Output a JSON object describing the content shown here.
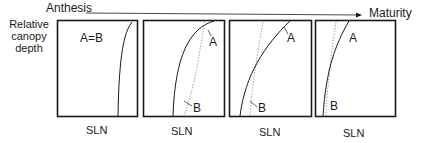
{
  "timeline": {
    "start_label": "Anthesis",
    "end_label": "Maturity"
  },
  "y_axis_label": "Relative canopy depth",
  "panels": [
    {
      "x_label": "SLN",
      "annotation": "A=B"
    },
    {
      "x_label": "SLN",
      "curve_a_label": "A",
      "curve_b_label": "B"
    },
    {
      "x_label": "SLN",
      "curve_a_label": "A",
      "curve_b_label": "B"
    },
    {
      "x_label": "SLN",
      "curve_a_label": "A",
      "curve_b_label": "B"
    }
  ],
  "colors": {
    "line": "#1a1a1a",
    "dotted": "#8a8a8a"
  }
}
